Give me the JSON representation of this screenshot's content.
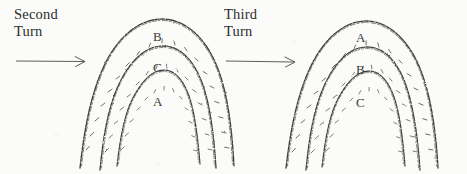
{
  "figure": {
    "background_color": "#fbfbfa",
    "ink_color": "#3a3a3a"
  },
  "captions": [
    {
      "id": "second",
      "line1": "Second",
      "line2": "Turn"
    },
    {
      "id": "third",
      "line1": "Third",
      "line2": "Turn"
    }
  ],
  "arrows": [
    {
      "id": "arrow-second-turn",
      "label": "arrow pointing right into second turn group"
    },
    {
      "id": "arrow-third-turn",
      "label": "arrow pointing right into third turn group"
    }
  ],
  "groups": [
    {
      "id": "second-turn",
      "caption": "Second Turn",
      "arches": [
        {
          "position": "outer",
          "label": "B"
        },
        {
          "position": "middle",
          "label": "C"
        },
        {
          "position": "inner",
          "label": "A"
        }
      ]
    },
    {
      "id": "third-turn",
      "caption": "Third Turn",
      "arches": [
        {
          "position": "outer",
          "label": "A"
        },
        {
          "position": "middle",
          "label": "B"
        },
        {
          "position": "inner",
          "label": "C"
        }
      ]
    }
  ]
}
